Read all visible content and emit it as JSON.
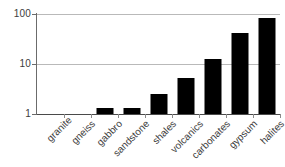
{
  "chart_data": {
    "type": "bar",
    "title": "",
    "subtitle": "",
    "xlabel": "",
    "ylabel": "",
    "yscale": "log",
    "ylim": [
      1,
      100
    ],
    "yticks": [
      1,
      10,
      100
    ],
    "ytick_labels": [
      "1",
      "10",
      "100"
    ],
    "grid": true,
    "legend": null,
    "bar_color": "#000000",
    "gridline_color": "#b9b9b9",
    "axis_color": "#6b6b6b",
    "categories": [
      "granite",
      "gneiss",
      "gabbro",
      "sandstone",
      "shales",
      "volcanics",
      "carbonates",
      "gypsum",
      "halites"
    ],
    "values": [
      1,
      1,
      1.3,
      1.3,
      2.5,
      5.3,
      12.5,
      42,
      85
    ],
    "series": [
      {
        "name": "",
        "values": [
          1,
          1,
          1.3,
          1.3,
          2.5,
          5.3,
          12.5,
          42,
          85
        ]
      }
    ]
  }
}
